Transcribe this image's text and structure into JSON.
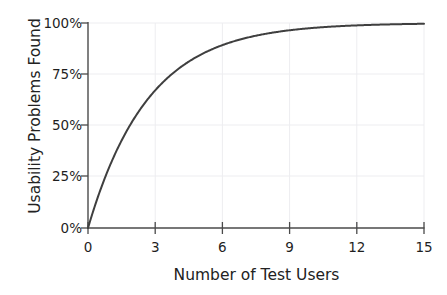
{
  "figure": {
    "clipped_header_text": "",
    "background_color": "#ffffff"
  },
  "axes": {
    "x_title": "Number of Test Users",
    "y_title": "Usability Problems Found",
    "x_tick_labels": [
      "0",
      "3",
      "6",
      "9",
      "12",
      "15"
    ],
    "y_tick_labels": [
      "0%",
      "25%",
      "50%",
      "75%",
      "100%"
    ],
    "axis_color": "#3a3a3a",
    "grid_color": "#ededf0",
    "tick_label_color": "#1f1f1f"
  },
  "chart_data": {
    "type": "line",
    "title": "",
    "subtitle": "",
    "xlabel": "Number of Test Users",
    "ylabel": "Usability Problems Found",
    "xlim": [
      0,
      15
    ],
    "ylim": [
      0,
      100
    ],
    "xticks": [
      0,
      3,
      6,
      9,
      12,
      15
    ],
    "yticks": [
      0,
      25,
      50,
      75,
      100
    ],
    "ytick_labels": [
      "0%",
      "25%",
      "50%",
      "75%",
      "100%"
    ],
    "xtick_labels": [
      "0",
      "3",
      "6",
      "9",
      "12",
      "15"
    ],
    "grid": true,
    "grid_axis": "both",
    "legend": false,
    "legend_position": "none",
    "annotations": [],
    "series": [
      {
        "name": "Usability problems found",
        "color": "#3f3f3f",
        "line_width": 2,
        "marker": "none",
        "formula": "100 * (1 - (1 - 0.31)^n)",
        "x": [
          0,
          0.5,
          1,
          1.5,
          2,
          2.5,
          3,
          3.5,
          4,
          4.5,
          5,
          5.5,
          6,
          6.5,
          7,
          7.5,
          8,
          8.5,
          9,
          9.5,
          10,
          10.5,
          11,
          11.5,
          12,
          12.5,
          13,
          13.5,
          14,
          14.5,
          15
        ],
        "values": [
          0,
          17.0,
          31.0,
          42.7,
          52.4,
          60.5,
          67.2,
          72.8,
          77.5,
          81.4,
          84.4,
          87.2,
          89.4,
          91.2,
          92.7,
          93.9,
          95.0,
          95.8,
          96.5,
          97.1,
          97.6,
          98.0,
          98.3,
          98.6,
          98.8,
          99.0,
          99.2,
          99.3,
          99.4,
          99.5,
          99.6
        ]
      }
    ]
  }
}
